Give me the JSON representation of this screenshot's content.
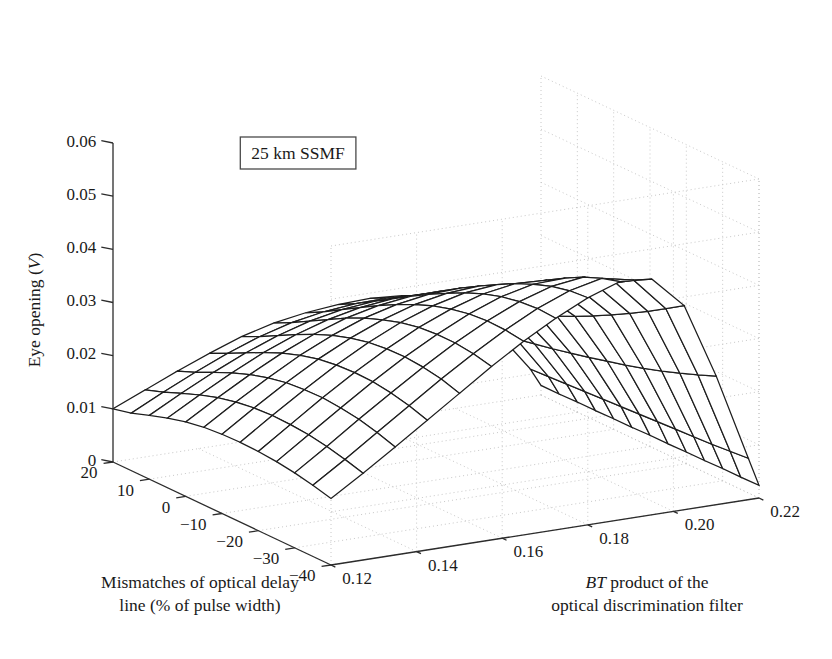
{
  "figure": {
    "width": 832,
    "height": 659,
    "background": "#ffffff",
    "line_color": "#1d1d1d",
    "axis_color": "#2b2b2b",
    "grid_color": "#c8c8c8"
  },
  "annotation": {
    "label": "25 km SSMF",
    "x": 298,
    "y": 159
  },
  "axes": {
    "z": {
      "title": "Eye opening (",
      "title_italic": "V",
      "title_suffix": ")",
      "ticks": [
        "0.06",
        "0.05",
        "0.04",
        "0.03",
        "0.02",
        "0.01",
        "0"
      ],
      "values": [
        0.06,
        0.05,
        0.04,
        0.03,
        0.02,
        0.01,
        0
      ],
      "min": 0,
      "max": 0.06
    },
    "x": {
      "title_line1": "Mismatches of optical delay",
      "title_line2": "line (% of pulse width)",
      "ticks": [
        "20",
        "10",
        "0",
        "−10",
        "−20",
        "−30",
        "−40"
      ],
      "values": [
        20,
        10,
        0,
        -10,
        -20,
        -30,
        -40
      ],
      "min": -40,
      "max": 20
    },
    "y": {
      "title_italic": "BT",
      "title_line1_rest": " product of the",
      "title_line2": "optical discrimination filter",
      "ticks": [
        "0.12",
        "0.14",
        "0.16",
        "0.18",
        "0.20",
        "0.22"
      ],
      "values": [
        0.12,
        0.14,
        0.16,
        0.18,
        0.2,
        0.22
      ],
      "min": 0.12,
      "max": 0.22
    }
  },
  "chart_data": {
    "type": "surface",
    "title": "25 km SSMF",
    "xlabel": "Mismatches of optical delay line (% of pulse width)",
    "ylabel": "BT product of the optical discrimination filter",
    "zlabel": "Eye opening (V)",
    "xlim": [
      -40,
      20
    ],
    "ylim": [
      0.12,
      0.22
    ],
    "zlim": [
      0,
      0.06
    ],
    "grid": true,
    "legend": "none",
    "x": [
      20,
      15,
      10,
      5,
      0,
      -5,
      -10,
      -15,
      -20,
      -25,
      -30,
      -35,
      -40
    ],
    "y": [
      0.12,
      0.1275,
      0.135,
      0.1425,
      0.15,
      0.1575,
      0.165,
      0.1725,
      0.18,
      0.1875,
      0.195,
      0.2025,
      0.21,
      0.2175,
      0.22
    ],
    "z": [
      [
        0.01,
        0.0126,
        0.0152,
        0.0176,
        0.0198,
        0.0214,
        0.0224,
        0.023,
        0.0232,
        0.0228,
        0.0215,
        0.0186,
        0.0128,
        0.0052,
        0.0018
      ],
      [
        0.0108,
        0.0138,
        0.0166,
        0.0192,
        0.0214,
        0.0231,
        0.0242,
        0.0248,
        0.0249,
        0.0244,
        0.0229,
        0.0196,
        0.0134,
        0.0054,
        0.0018
      ],
      [
        0.012,
        0.0152,
        0.0182,
        0.0209,
        0.0232,
        0.025,
        0.0262,
        0.0268,
        0.0268,
        0.0261,
        0.0244,
        0.0208,
        0.0141,
        0.0056,
        0.0019
      ],
      [
        0.0131,
        0.0165,
        0.0197,
        0.0226,
        0.025,
        0.0269,
        0.0282,
        0.0289,
        0.0289,
        0.0281,
        0.0261,
        0.0221,
        0.0148,
        0.0058,
        0.0019
      ],
      [
        0.014,
        0.0176,
        0.021,
        0.0241,
        0.0267,
        0.0288,
        0.0302,
        0.031,
        0.0311,
        0.0302,
        0.028,
        0.0236,
        0.0156,
        0.006,
        0.002
      ],
      [
        0.0146,
        0.0184,
        0.022,
        0.0253,
        0.0281,
        0.0304,
        0.032,
        0.033,
        0.0332,
        0.0323,
        0.0299,
        0.0251,
        0.0164,
        0.0062,
        0.002
      ],
      [
        0.0149,
        0.0189,
        0.0227,
        0.0262,
        0.0292,
        0.0317,
        0.0336,
        0.0348,
        0.0352,
        0.0344,
        0.0319,
        0.0267,
        0.0173,
        0.0064,
        0.0021
      ],
      [
        0.015,
        0.0191,
        0.023,
        0.0267,
        0.03,
        0.0328,
        0.035,
        0.0365,
        0.0371,
        0.0365,
        0.0339,
        0.0284,
        0.0182,
        0.0066,
        0.0021
      ],
      [
        0.0149,
        0.019,
        0.0231,
        0.0269,
        0.0304,
        0.0335,
        0.036,
        0.0379,
        0.0389,
        0.0386,
        0.036,
        0.0302,
        0.0192,
        0.0068,
        0.0022
      ],
      [
        0.0146,
        0.0187,
        0.0228,
        0.0268,
        0.0305,
        0.0338,
        0.0367,
        0.039,
        0.0404,
        0.0406,
        0.0382,
        0.0321,
        0.0203,
        0.007,
        0.0022
      ],
      [
        0.0141,
        0.0181,
        0.0223,
        0.0263,
        0.0302,
        0.0338,
        0.037,
        0.0397,
        0.0416,
        0.0424,
        0.0404,
        0.0341,
        0.0215,
        0.0072,
        0.0023
      ],
      [
        0.0134,
        0.0173,
        0.0214,
        0.0255,
        0.0296,
        0.0334,
        0.0369,
        0.04,
        0.0424,
        0.0438,
        0.0425,
        0.0362,
        0.0228,
        0.0075,
        0.0023
      ],
      [
        0.0125,
        0.0163,
        0.0203,
        0.0244,
        0.0285,
        0.0326,
        0.0364,
        0.0398,
        0.0427,
        0.0448,
        0.0443,
        0.0384,
        0.0242,
        0.0078,
        0.0024
      ]
    ],
    "z_max": 0.0448,
    "z_min": 0.0018
  },
  "projection": {
    "origin_x": 113,
    "origin_y": 462,
    "ex_x": 218,
    "ex_y": 103,
    "ey_x": 428,
    "ey_y": -67,
    "ez_x": 0,
    "ez_y": -319
  }
}
